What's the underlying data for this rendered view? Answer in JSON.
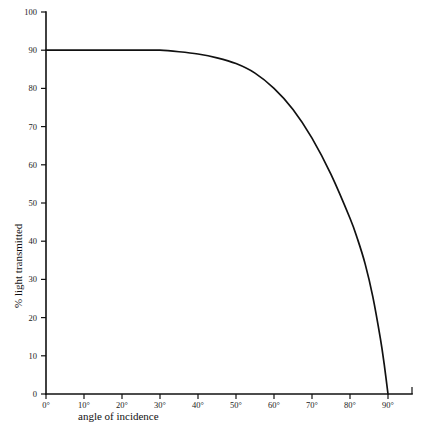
{
  "chart_data": {
    "type": "line",
    "title": "",
    "xlabel": "angle of incidence",
    "ylabel": "% light transmitted",
    "xlim": [
      0,
      90
    ],
    "ylim": [
      0,
      100
    ],
    "grid": false,
    "legend": "none",
    "xtick_labels": [
      "0°",
      "10°",
      "20°",
      "30°",
      "40°",
      "50°",
      "60°",
      "70°",
      "80°",
      "90°"
    ],
    "xticks": [
      0,
      10,
      20,
      30,
      40,
      50,
      60,
      70,
      80,
      90
    ],
    "ytick_labels": [
      "0",
      "10",
      "20",
      "30",
      "40",
      "50",
      "60",
      "70",
      "80",
      "90",
      "100"
    ],
    "yticks": [
      0,
      10,
      20,
      30,
      40,
      50,
      60,
      70,
      80,
      90,
      100
    ],
    "series": [
      {
        "name": "light transmitted",
        "color": "#111111",
        "x": [
          0,
          5,
          10,
          15,
          20,
          25,
          30,
          35,
          40,
          45,
          50,
          55,
          60,
          65,
          70,
          75,
          80,
          82,
          84,
          86,
          88,
          89,
          90
        ],
        "values": [
          90,
          90,
          90,
          90,
          90,
          90,
          90,
          89.6,
          89,
          88,
          86.5,
          84,
          80,
          74.5,
          67,
          57.5,
          46,
          40.5,
          34,
          25.5,
          14.5,
          7.8,
          0
        ]
      }
    ]
  },
  "axes": {
    "x_axis_name": "x-axis",
    "y_axis_name": "y-axis"
  }
}
